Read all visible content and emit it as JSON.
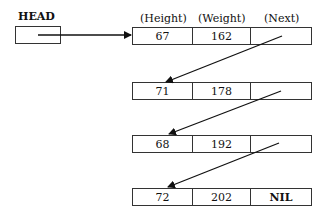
{
  "head": {
    "label": "HEAD"
  },
  "columns": {
    "height": "(Height)",
    "weight": "(Weight)",
    "next": "(Next)"
  },
  "nodes": [
    {
      "height": "67",
      "weight": "162",
      "next": ""
    },
    {
      "height": "71",
      "weight": "178",
      "next": ""
    },
    {
      "height": "68",
      "weight": "192",
      "next": ""
    },
    {
      "height": "72",
      "weight": "202",
      "next": "NIL"
    }
  ]
}
